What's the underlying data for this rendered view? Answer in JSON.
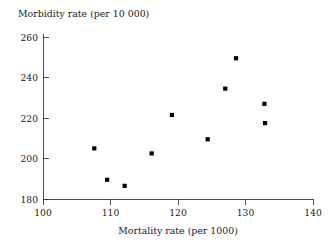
{
  "chart_data": {
    "type": "scatter",
    "title": "",
    "xlabel": "Mortality rate (per 1000)",
    "ylabel": "Morbidity rate (per 10 000)",
    "xlim": [
      100,
      140
    ],
    "ylim": [
      180,
      260
    ],
    "xticks": [
      100,
      110,
      120,
      130,
      140
    ],
    "yticks": [
      180,
      200,
      220,
      240,
      260
    ],
    "xtick_labels": [
      "100",
      "110",
      "120",
      "130",
      "140"
    ],
    "ytick_labels": [
      "180",
      "200",
      "220",
      "240",
      "260"
    ],
    "grid": false,
    "legend": null,
    "marker": "filled-square",
    "marker_color": "#000000",
    "x": [
      107.6,
      109.5,
      112.1,
      116.1,
      119.1,
      124.4,
      127.0,
      128.6,
      132.8,
      132.9,
      128.6
    ],
    "y": [
      205.0,
      189.5,
      186.5,
      202.5,
      221.5,
      209.5,
      234.5,
      249.5,
      227.0,
      217.5,
      249.5
    ],
    "points": [
      {
        "x": 107.6,
        "y": 205.0
      },
      {
        "x": 109.5,
        "y": 189.5
      },
      {
        "x": 112.1,
        "y": 186.5
      },
      {
        "x": 116.1,
        "y": 202.5
      },
      {
        "x": 119.1,
        "y": 221.5
      },
      {
        "x": 124.4,
        "y": 209.5
      },
      {
        "x": 127.0,
        "y": 234.5
      },
      {
        "x": 128.6,
        "y": 249.5
      },
      {
        "x": 132.8,
        "y": 227.0
      },
      {
        "x": 132.9,
        "y": 217.5
      }
    ]
  },
  "axes": {
    "y_axis_title": "Morbidity rate (per 10 000)",
    "x_axis_title": "Mortality rate (per 1000)"
  },
  "colors": {
    "background": "#ffffff",
    "axis": "#3a3a3a",
    "marker": "#000000",
    "text": "#1a1a1a"
  }
}
